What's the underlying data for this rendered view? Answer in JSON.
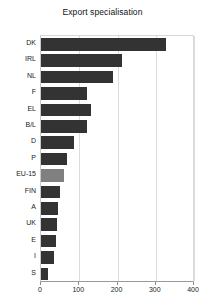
{
  "chart": {
    "title": "Export specialisation",
    "type": "bar",
    "orientation": "horizontal",
    "highlight_category": "EU-15",
    "colors": {
      "bar": "#333333",
      "highlight_bar": "#808080",
      "grid": "#dcdcdc",
      "axis": "#9a9a9a",
      "text": "#222222"
    }
  },
  "chart_data": {
    "type": "bar",
    "title": "Export specialisation",
    "xlabel": "",
    "ylabel": "",
    "orientation": "horizontal",
    "xlim": [
      0,
      400
    ],
    "ylim": null,
    "grid": true,
    "legend": null,
    "xticks": [
      0,
      100,
      200,
      300,
      400
    ],
    "xtick_labels": [
      "0",
      "100",
      "200",
      "300",
      "400"
    ],
    "categories": [
      "DK",
      "IRL",
      "NL",
      "F",
      "EL",
      "B/L",
      "D",
      "P",
      "EU-15",
      "FIN",
      "A",
      "UK",
      "E",
      "I",
      "S"
    ],
    "values": [
      326,
      212,
      189,
      120,
      130,
      120,
      86,
      68,
      60,
      49,
      44,
      41,
      38,
      34,
      18
    ],
    "series": [
      {
        "name": "Export specialisation",
        "values": [
          326,
          212,
          189,
          120,
          130,
          120,
          86,
          68,
          60,
          49,
          44,
          41,
          38,
          34,
          18
        ]
      }
    ],
    "highlight": {
      "category": "EU-15",
      "index": 8,
      "color": "#808080"
    }
  }
}
